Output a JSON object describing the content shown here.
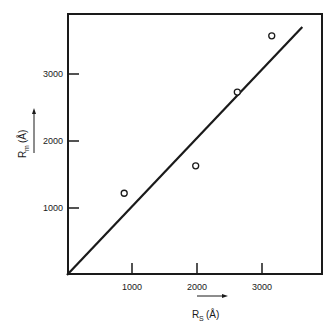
{
  "chart_data": {
    "type": "scatter",
    "title": "",
    "xlabel": "R_S (Å)",
    "ylabel": "R_m (Å)",
    "x_label_parts": {
      "main": "R",
      "sub": "S",
      "unit": "(Å)"
    },
    "y_label_parts": {
      "main": "R",
      "sub": "m",
      "unit": "(Å)"
    },
    "xlim": [
      0,
      4000
    ],
    "ylim": [
      0,
      3900
    ],
    "xticks": [
      1000,
      2000,
      3000
    ],
    "yticks": [
      1000,
      2000,
      3000
    ],
    "xtick_labels": [
      "1000",
      "2000",
      "3000"
    ],
    "ytick_labels": [
      "1000",
      "2000",
      "3000"
    ],
    "grid": false,
    "legend": null,
    "series": [
      {
        "name": "measured",
        "marker": "open-circle",
        "points": [
          {
            "x": 880,
            "y": 1220
          },
          {
            "x": 1980,
            "y": 1630
          },
          {
            "x": 2620,
            "y": 2730
          },
          {
            "x": 3150,
            "y": 3570
          }
        ]
      },
      {
        "name": "fit-line",
        "style": "solid-line",
        "points": [
          {
            "x": 0,
            "y": 0
          },
          {
            "x": 3620,
            "y": 3700
          }
        ]
      }
    ],
    "annotations": [
      {
        "type": "arrow",
        "direction": "right",
        "near": "x-axis-label"
      },
      {
        "type": "arrow",
        "direction": "up",
        "near": "y-axis-label"
      }
    ]
  },
  "colors": {
    "ink": "#1a1a1a",
    "background": "#ffffff"
  }
}
